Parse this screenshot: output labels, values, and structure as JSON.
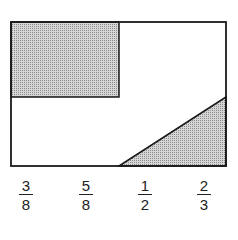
{
  "diagram": {
    "colors": {
      "stroke": "#1a1a1a",
      "shade": "#b8b8b8",
      "background": "#ffffff"
    }
  },
  "choices": [
    {
      "numerator": "3",
      "denominator": "8"
    },
    {
      "numerator": "5",
      "denominator": "8"
    },
    {
      "numerator": "1",
      "denominator": "2"
    },
    {
      "numerator": "2",
      "denominator": "3"
    }
  ]
}
